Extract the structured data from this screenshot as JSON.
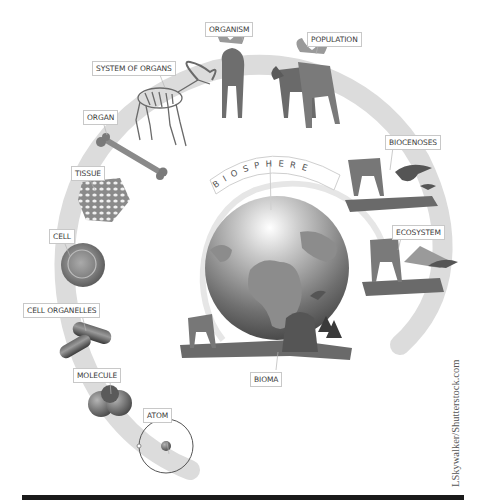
{
  "diagram": {
    "title": "BIOSPHERE",
    "levels": [
      {
        "id": "atom",
        "label": "ATOM"
      },
      {
        "id": "molecule",
        "label": "MOLECULE"
      },
      {
        "id": "cell-organelles",
        "label": "CELL ORGANELLES"
      },
      {
        "id": "cell",
        "label": "CELL"
      },
      {
        "id": "tissue",
        "label": "TISSUE"
      },
      {
        "id": "organ",
        "label": "ORGAN"
      },
      {
        "id": "system-of-organs",
        "label": "SYSTEM OF ORGANS"
      },
      {
        "id": "organism",
        "label": "ORGANISM"
      },
      {
        "id": "population",
        "label": "POPULATION"
      },
      {
        "id": "biocenoses",
        "label": "BIOCENOSES"
      },
      {
        "id": "ecosystem",
        "label": "ECOSYSTEM"
      },
      {
        "id": "bioma",
        "label": "BIOMA"
      }
    ],
    "credit": "LSkywalker/Shutterstock.com",
    "colors": {
      "arc": "#dcdcdc",
      "label_border": "#c8c8c8",
      "label_text": "#3a3a3a",
      "bar": "#1a1a1a"
    }
  }
}
